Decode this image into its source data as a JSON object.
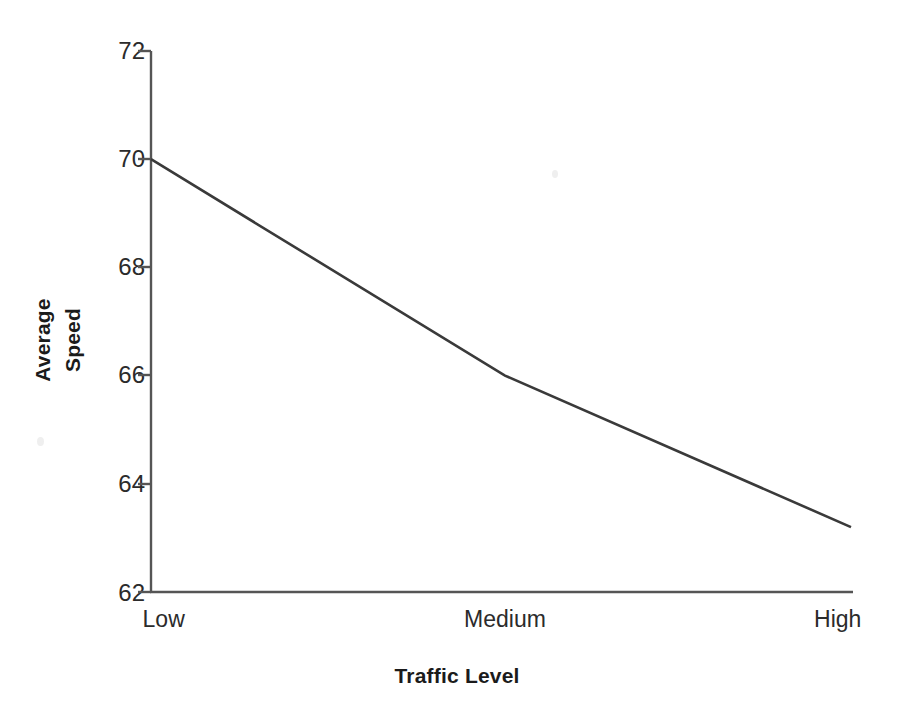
{
  "chart_data": {
    "type": "line",
    "title": "",
    "xlabel": "Traffic Level",
    "ylabel": "Average Speed",
    "ylabel_line1": "Average",
    "ylabel_line2": "Speed",
    "categories": [
      "Low",
      "Medium",
      "High"
    ],
    "values": [
      70,
      66,
      63.2
    ],
    "series": [
      {
        "name": "Average Speed",
        "values": [
          70,
          66,
          63.2
        ]
      }
    ],
    "ylim": [
      62,
      72
    ],
    "yticks": [
      72,
      70,
      68,
      66,
      64,
      62
    ],
    "ytick_labels": [
      "72",
      "70",
      "68",
      "66",
      "64",
      "62"
    ],
    "xtick_labels": [
      "Low",
      "Medium",
      "High"
    ],
    "grid": false,
    "legend": false,
    "legend_position": "none",
    "line_color": "#3a3a3a",
    "axis_color": "#555555",
    "background_color": "#ffffff",
    "text_color": "#2b2b2b"
  },
  "axis": {
    "y_title_line1": "Average",
    "y_title_line2": "Speed",
    "x_title": "Traffic Level"
  },
  "ticks": {
    "y": [
      {
        "label": "72",
        "value": 72
      },
      {
        "label": "70",
        "value": 70
      },
      {
        "label": "68",
        "value": 68
      },
      {
        "label": "66",
        "value": 66
      },
      {
        "label": "64",
        "value": 64
      },
      {
        "label": "62",
        "value": 62
      }
    ],
    "x": [
      {
        "label": "Low",
        "value": 70
      },
      {
        "label": "Medium",
        "value": 66
      },
      {
        "label": "High",
        "value": 63.2
      }
    ]
  }
}
